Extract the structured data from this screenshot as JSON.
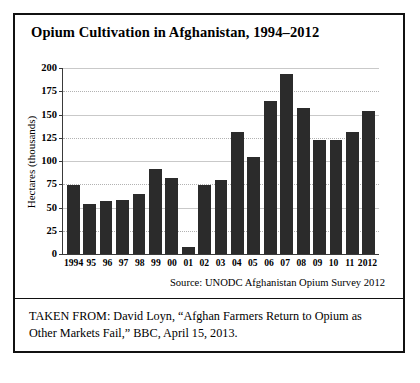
{
  "figure": {
    "title": "Opium Cultivation in Afghanistan, 1994–2012",
    "source_note": "Source: UNODC Afghanistan Opium Survey 2012",
    "caption": "TAKEN FROM: David Loyn, “Afghan Farmers Return to Opium as Other Markets Fail,” BBC, April 15, 2013.",
    "frame_color": "#111111",
    "bar_color": "#2b2b2b",
    "grid_color": "#b2b2b2"
  },
  "chart_data": {
    "type": "bar",
    "title": "Opium Cultivation in Afghanistan, 1994–2012",
    "xlabel": "",
    "ylabel": "Hectares (thousands)",
    "ylim": [
      0,
      200
    ],
    "yticks": [
      0,
      25,
      50,
      75,
      100,
      125,
      150,
      175,
      200
    ],
    "ytick_labels": [
      "0",
      "25",
      "50",
      "75",
      "100",
      "125",
      "150",
      "175",
      "200"
    ],
    "grid": true,
    "legend": false,
    "categories": [
      "1994",
      "95",
      "96",
      "97",
      "98",
      "99",
      "00",
      "01",
      "02",
      "03",
      "04",
      "05",
      "06",
      "07",
      "08",
      "09",
      "10",
      "11",
      "2012"
    ],
    "values": [
      74,
      54,
      57,
      58,
      64,
      91,
      82,
      8,
      74,
      80,
      131,
      104,
      165,
      194,
      157,
      123,
      123,
      131,
      154
    ],
    "series": [
      {
        "name": "Hectares under opium cultivation (thousands)",
        "values": [
          74,
          54,
          57,
          58,
          64,
          91,
          82,
          8,
          74,
          80,
          131,
          104,
          165,
          194,
          157,
          123,
          123,
          131,
          154
        ]
      }
    ],
    "annotations": [
      "Source: UNODC Afghanistan Opium Survey 2012"
    ]
  }
}
